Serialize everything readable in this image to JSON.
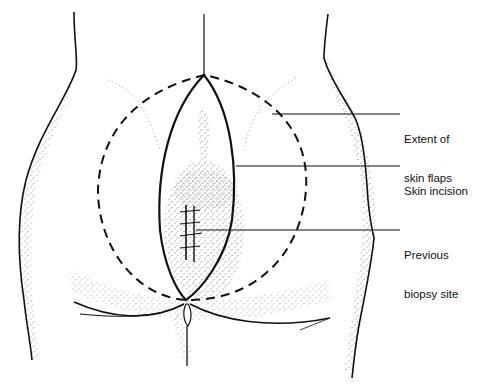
{
  "diagram": {
    "labels": [
      {
        "id": "extent",
        "line1": "Extent of",
        "line2": "skin flaps"
      },
      {
        "id": "incision",
        "line1": "Skin incision",
        "line2": ""
      },
      {
        "id": "biopsy",
        "line1": "Previous",
        "line2": "biopsy site"
      }
    ],
    "colors": {
      "ink": "#111111",
      "stipple": "#555555",
      "background": "#ffffff"
    }
  }
}
